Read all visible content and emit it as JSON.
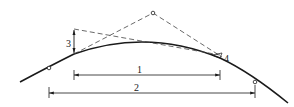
{
  "diagram": {
    "type": "vertical-curve-geometry",
    "colors": {
      "line": "#1a1a1a",
      "dashed": "#444444",
      "background": "#ffffff"
    },
    "labels": {
      "dim1": "1",
      "dim2": "2",
      "dim3": "3",
      "dim4": "4"
    },
    "points": {
      "curve_start_marker": [
        49,
        68
      ],
      "curve_end_marker": [
        255,
        82
      ],
      "apex_marker": [
        153,
        13
      ]
    }
  }
}
